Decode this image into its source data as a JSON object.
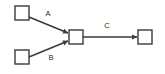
{
  "diagram": {
    "background_color": "#ffffff",
    "stroke_color": "#3a3a3a",
    "label_color": "#2b2b2b",
    "nodes": [
      {
        "id": "n1",
        "label": "",
        "name": "node-top-left",
        "x": 15,
        "y": 6,
        "w": 14,
        "h": 14
      },
      {
        "id": "n2",
        "label": "",
        "name": "node-bottom-left",
        "x": 15,
        "y": 50,
        "w": 14,
        "h": 14
      },
      {
        "id": "n3",
        "label": "",
        "name": "node-center",
        "x": 69,
        "y": 30,
        "w": 14,
        "h": 14
      },
      {
        "id": "n4",
        "label": "",
        "name": "node-right",
        "x": 138,
        "y": 30,
        "w": 14,
        "h": 14
      }
    ],
    "edges": [
      {
        "id": "e1",
        "label": "A",
        "name": "edge-a",
        "from": "n1",
        "to": "n3",
        "x1": 29,
        "y1": 17,
        "x2": 68,
        "y2": 33,
        "label_x": 48,
        "label_y": 14
      },
      {
        "id": "e2",
        "label": "B",
        "name": "edge-b",
        "from": "n2",
        "to": "n3",
        "x1": 29,
        "y1": 57,
        "x2": 68,
        "y2": 41,
        "label_x": 51,
        "label_y": 58
      },
      {
        "id": "e3",
        "label": "C",
        "name": "edge-c",
        "from": "n3",
        "to": "n4",
        "x1": 83,
        "y1": 37,
        "x2": 137,
        "y2": 37,
        "label_x": 107,
        "label_y": 26
      }
    ]
  }
}
